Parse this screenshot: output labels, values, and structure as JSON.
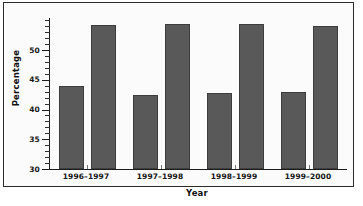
{
  "chart_data": {
    "type": "bar",
    "title": "",
    "xlabel": "Year",
    "ylabel": "Percentage",
    "categories": [
      "1996–1997",
      "1997–1998",
      "1998–1999",
      "1999–2000"
    ],
    "series": [
      {
        "name": "series-1",
        "values": [
          43.9,
          42.5,
          42.8,
          42.9
        ]
      },
      {
        "name": "series-2",
        "values": [
          54.2,
          54.4,
          54.3,
          54.0
        ]
      }
    ],
    "ylim": [
      30,
      55
    ],
    "ytick_labels": [
      "30",
      "35",
      "40",
      "45",
      "50"
    ],
    "ytick_values": [
      30,
      35,
      40,
      45,
      50
    ],
    "minor_tick_interval": 1,
    "grid": false,
    "legend": "none",
    "bar_color": "#595959",
    "bar_edge_color": "#3d3d3d",
    "axis_color": "#1c1c1c",
    "background_color": "#fbfbfb",
    "frame_color": "#2b2b2b"
  }
}
